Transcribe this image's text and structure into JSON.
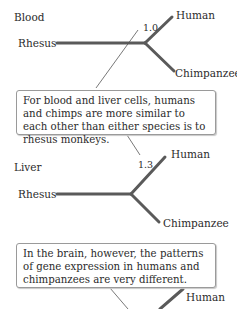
{
  "panels": [
    {
      "title": "Blood",
      "distance": "1.0",
      "outgroup": "Rhesus",
      "taxa": [
        "Human",
        "Chimpanzee"
      ]
    },
    {
      "title": "Liver",
      "distance": "1.3",
      "outgroup": "Rhesus",
      "taxa": [
        "Human",
        "Chimpanzee"
      ]
    },
    {
      "title": "Brain",
      "taxa": [
        "Human"
      ]
    }
  ],
  "callouts": [
    {
      "text": "For blood and liver cells, humans and chimps are more similar to each other than either species is to rhesus monkeys."
    },
    {
      "text": "In the brain, however, the patterns of gene expression in humans and chimpanzees are very different."
    }
  ],
  "colors": {
    "branch": "#5a5a5a",
    "leader": "#555555",
    "box_border": "#9a9a9a"
  }
}
